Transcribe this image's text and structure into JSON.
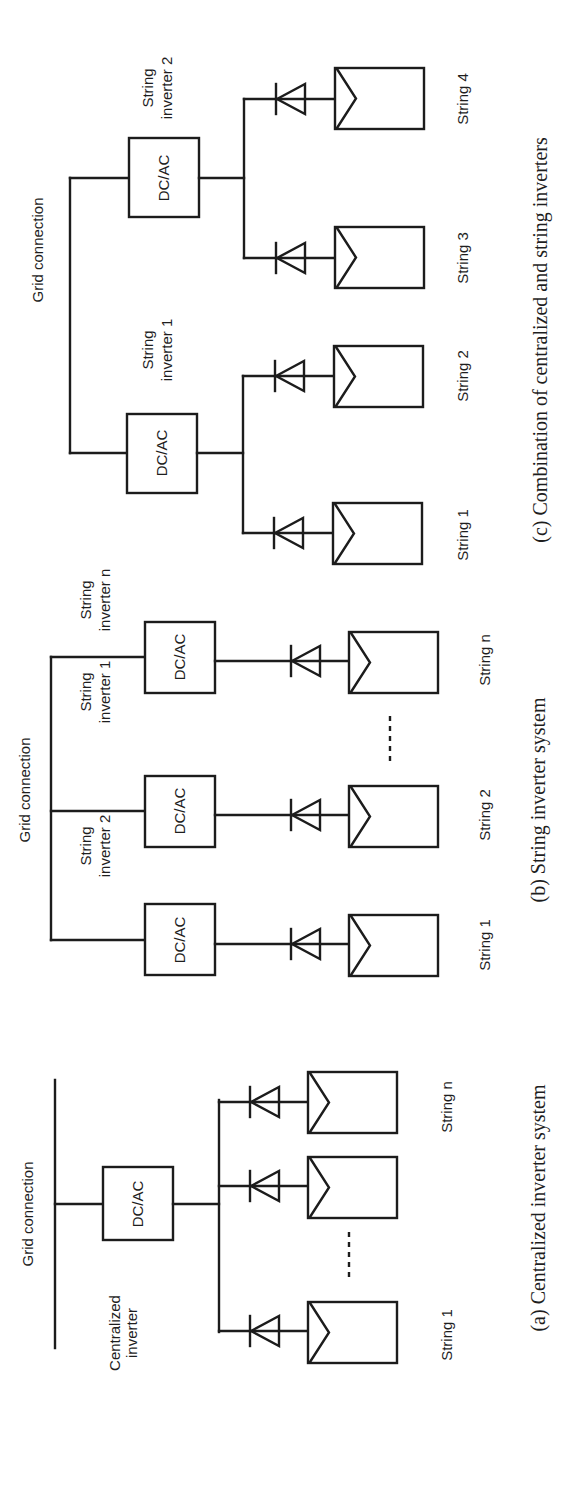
{
  "figure": {
    "orientation": "rotated 90 degrees counter-clockwise",
    "panels": [
      {
        "id": "a",
        "caption": "(a) Centralized inverter system",
        "grid_label": "Grid connection",
        "inverter_label_line1": "Centralized",
        "inverter_label_line2": "inverter",
        "converter": "DC/AC",
        "strings": [
          "String 1",
          "String n"
        ],
        "ellipsis": "-----"
      },
      {
        "id": "b",
        "caption": "(b) String inverter system",
        "grid_label": "Grid connection",
        "converter": "DC/AC",
        "inverters": [
          {
            "line1": "String",
            "line2": "inverter 1"
          },
          {
            "line1": "String",
            "line2": "inverter 2"
          },
          {
            "line1": "String",
            "line2": "inverter n"
          }
        ],
        "strings": [
          "String 1",
          "String 2",
          "String n"
        ],
        "ellipsis": "-----"
      },
      {
        "id": "c",
        "caption": "(c) Combination of centralized and string inverters",
        "grid_label": "Grid connection",
        "converter": "DC/AC",
        "inverters": [
          {
            "line1": "String",
            "line2": "inverter 1"
          },
          {
            "line1": "String",
            "line2": "inverter 2"
          }
        ],
        "strings": [
          "String 1",
          "String 2",
          "String 3",
          "String 4"
        ]
      }
    ]
  }
}
